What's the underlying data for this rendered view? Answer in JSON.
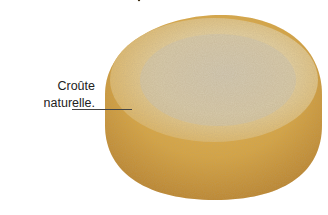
{
  "image": {
    "subject": "cheese wheel",
    "annotation": {
      "line1": "Croûte",
      "line2": "naturelle."
    },
    "colors": {
      "rind_side": "#d7a440",
      "rind_side_dark": "#b8802a",
      "top_surface": "#e6cf9c",
      "top_mottling": "#c9c0ad",
      "background": "#ffffff"
    }
  }
}
